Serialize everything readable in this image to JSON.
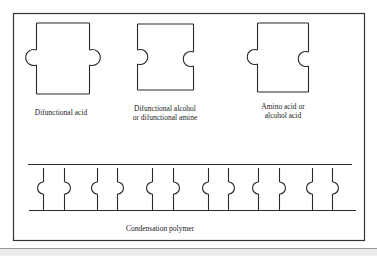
{
  "figure": {
    "frame": {
      "stroke": "#333333"
    },
    "line_color": "#2a2a2a",
    "monomers": [
      {
        "id": "difunctional-acid",
        "label_lines": [
          "Difunctional acid"
        ],
        "left_end": "knob",
        "right_end": "knob"
      },
      {
        "id": "difunctional-alcohol-amine",
        "label_lines": [
          "Difunctional alcohol",
          "or difunctional amine"
        ],
        "left_end": "socket",
        "right_end": "socket"
      },
      {
        "id": "amino-alcohol-acid",
        "label_lines": [
          "Amino acid or",
          "alcohol acid"
        ],
        "left_end": "knob",
        "right_end": "socket"
      }
    ],
    "polymer": {
      "label": "Condensation polymer",
      "unit_pairs": 6,
      "pattern": [
        "knob-left",
        "knob-right"
      ]
    }
  },
  "labels": {
    "acid_1": "Difunctional acid",
    "alcohol_1": "Difunctional alcohol",
    "alcohol_2": "or difunctional amine",
    "amino_1": "Amino acid or",
    "amino_2": "alcohol acid",
    "polymer": "Condensation polymer"
  }
}
